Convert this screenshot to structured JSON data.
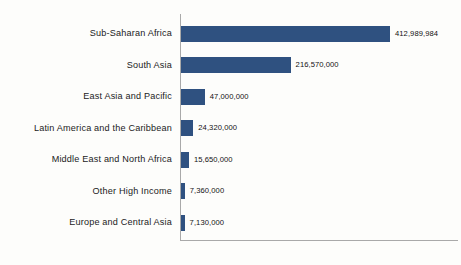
{
  "chart_data": {
    "type": "bar",
    "orientation": "horizontal",
    "title": "",
    "subtitle": "",
    "xlabel": "",
    "ylabel": "",
    "grid": false,
    "legend": false,
    "legend_position": "none",
    "axis_tick_labels": [],
    "xlim": [
      0,
      412989984
    ],
    "bar_color": "#2f5180",
    "axis_color": "#a9a9a9",
    "background_color": "#fdfdfb",
    "categories": [
      "Sub-Saharan Africa",
      "South Asia",
      "East Asia and Pacific",
      "Latin America and the Caribbean",
      "Middle East and North Africa",
      "Other High Income",
      "Europe and Central Asia"
    ],
    "values": [
      412989984,
      216570000,
      47000000,
      24320000,
      15650000,
      7360000,
      7130000
    ],
    "value_labels": [
      "412,989,984",
      "216,570,000",
      "47,000,000",
      "24,320,000",
      "15,650,000",
      "7,360,000",
      "7,130,000"
    ]
  }
}
